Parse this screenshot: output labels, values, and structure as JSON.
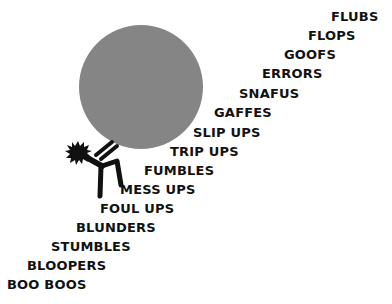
{
  "illustration": {
    "boulder": {
      "cx": 141,
      "cy": 87,
      "r": 62,
      "color": "#858585"
    },
    "figure_color": "#111111",
    "stairs": [
      {
        "label": "FLUBS",
        "x": 331,
        "y": 11
      },
      {
        "label": "FLOPS",
        "x": 308,
        "y": 30
      },
      {
        "label": "GOOFS",
        "x": 284,
        "y": 49
      },
      {
        "label": "ERRORS",
        "x": 262,
        "y": 68
      },
      {
        "label": "SNAFUS",
        "x": 239,
        "y": 88
      },
      {
        "label": "GAFFES",
        "x": 214,
        "y": 107
      },
      {
        "label": "SLIP UPS",
        "x": 193,
        "y": 127
      },
      {
        "label": "TRIP UPS",
        "x": 170,
        "y": 146
      },
      {
        "label": "FUMBLES",
        "x": 144,
        "y": 165
      },
      {
        "label": "MESS UPS",
        "x": 120,
        "y": 184
      },
      {
        "label": "FOUL UPS",
        "x": 100,
        "y": 203
      },
      {
        "label": "BLUNDERS",
        "x": 76,
        "y": 222
      },
      {
        "label": "STUMBLES",
        "x": 51,
        "y": 241
      },
      {
        "label": "BLOOPERS",
        "x": 27,
        "y": 260
      },
      {
        "label": "BOO BOOS",
        "x": 7,
        "y": 279
      }
    ]
  }
}
